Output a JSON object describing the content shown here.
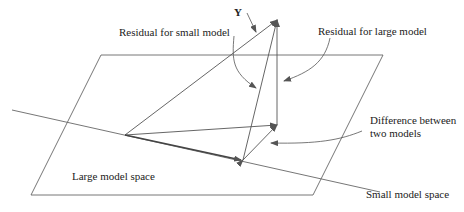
{
  "diagram": {
    "labels": {
      "y": "Y",
      "residual_small": "Residual for small  model",
      "residual_large": "Residual for large model",
      "difference_line1": "Difference between",
      "difference_line2": "two models",
      "large_space": "Large model space",
      "small_space": "Small model space"
    },
    "colors": {
      "line": "#555555",
      "text": "#222222",
      "background": "#ffffff"
    }
  }
}
